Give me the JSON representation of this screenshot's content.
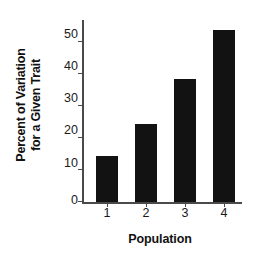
{
  "chart_data": {
    "type": "bar",
    "title": "",
    "subtitle": "",
    "categories": [
      "1",
      "2",
      "3",
      "4"
    ],
    "values": [
      14.5,
      24.5,
      38.5,
      54
    ],
    "series": [
      {
        "name": "Percent of Variation for a Given Trait",
        "values": [
          14.5,
          24.5,
          38.5,
          54
        ]
      }
    ],
    "xlabel": "Population",
    "ylabel_line1": "Percent of Variation",
    "ylabel_line2": "for a Given Trait",
    "ylabel": "Percent of Variation for a Given Trait",
    "ylim": [
      0,
      57
    ],
    "yticks": [
      0,
      10,
      20,
      30,
      40,
      50
    ],
    "ytick_labels": [
      "0",
      "10",
      "20",
      "30",
      "40",
      "50"
    ],
    "xtick_labels": [
      "1",
      "2",
      "3",
      "4"
    ],
    "grid": false,
    "legend": false,
    "legend_position": "none",
    "bar_color": "#121212",
    "axis_color": "#4a4a4a",
    "background_color": "#ffffff",
    "annotations": []
  }
}
